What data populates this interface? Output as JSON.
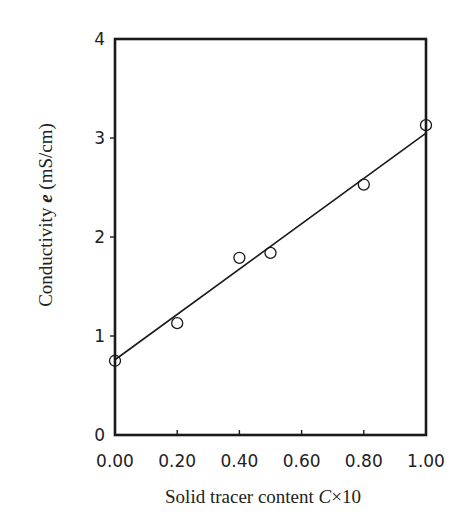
{
  "chart_data": {
    "type": "scatter",
    "title": "",
    "xlabel": "Solid tracer content C×10",
    "xlabel_parts": {
      "text": "Solid tracer content ",
      "var": "C",
      "suffix": "×10"
    },
    "ylabel": "Conductivity e (mS/cm)",
    "ylabel_parts": {
      "prefix": "Conductivity ",
      "var": "e",
      "suffix": " (mS/cm)"
    },
    "xlim": [
      0.0,
      1.0
    ],
    "ylim": [
      0,
      4
    ],
    "x_ticks": [
      "0.00",
      "0.20",
      "0.40",
      "0.60",
      "0.80",
      "1.00"
    ],
    "x_tick_values": [
      0.0,
      0.2,
      0.4,
      0.6,
      0.8,
      1.0
    ],
    "y_ticks": [
      "0",
      "1",
      "2",
      "3",
      "4"
    ],
    "y_tick_values": [
      0,
      1,
      2,
      3,
      4
    ],
    "grid": false,
    "legend": null,
    "series": [
      {
        "name": "measured",
        "marker": "open-circle",
        "x": [
          0.0,
          0.2,
          0.4,
          0.5,
          0.8,
          1.0
        ],
        "y": [
          0.75,
          1.13,
          1.79,
          1.84,
          2.53,
          3.13
        ]
      },
      {
        "name": "linear fit",
        "type": "line",
        "x": [
          0.0,
          1.0
        ],
        "y": [
          0.76,
          3.05
        ]
      }
    ]
  }
}
